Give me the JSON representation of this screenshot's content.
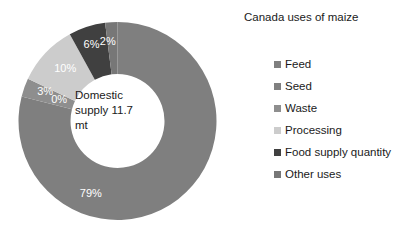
{
  "legend": {
    "title": "Canada uses of maize"
  },
  "center": {
    "line1": "Domestic",
    "line2": "supply 11.7",
    "line3": "mt"
  },
  "chart_data": {
    "type": "pie",
    "variant": "donut",
    "title": "Canada uses of maize",
    "center_label": "Domestic supply 11.7 mt",
    "unit": "%",
    "total_label": "Domestic supply 11.7 mt",
    "legend_position": "right",
    "grid": false,
    "start_angle_deg": 0,
    "direction": "clockwise",
    "categories": [
      "Feed",
      "Seed",
      "Waste",
      "Processing",
      "Food supply quantity",
      "Other uses"
    ],
    "values": [
      79,
      0,
      3,
      10,
      6,
      2
    ],
    "data_labels": [
      "79%",
      "0%",
      "3%",
      "10%",
      "6%",
      "2%"
    ],
    "colors": [
      "#7f7f7f",
      "#808080",
      "#8e8e8e",
      "#cccccc",
      "#404040",
      "#777777"
    ],
    "slices": [
      {
        "label": "Feed",
        "value": 79,
        "display": "79%",
        "color": "#7f7f7f"
      },
      {
        "label": "Seed",
        "value": 0,
        "display": "0%",
        "color": "#808080"
      },
      {
        "label": "Waste",
        "value": 3,
        "display": "3%",
        "color": "#8e8e8e"
      },
      {
        "label": "Processing",
        "value": 10,
        "display": "10%",
        "color": "#cccccc"
      },
      {
        "label": "Food supply quantity",
        "value": 6,
        "display": "6%",
        "color": "#404040"
      },
      {
        "label": "Other uses",
        "value": 2,
        "display": "2%",
        "color": "#777777"
      }
    ]
  }
}
